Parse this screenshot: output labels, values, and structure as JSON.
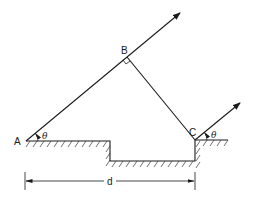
{
  "diagram": {
    "points": {
      "A": {
        "label": "A",
        "x": 26,
        "y": 141
      },
      "B": {
        "label": "B",
        "x": 127,
        "y": 57
      },
      "C": {
        "label": "C",
        "x": 195,
        "y": 140
      }
    },
    "angles": {
      "at_A": "θ",
      "at_C": "θ"
    },
    "dimension": {
      "label": "d",
      "from": "A",
      "to": "C"
    },
    "annotations": {
      "right_angle_at": "B"
    },
    "colors": {
      "line": "#1a1a1a",
      "background": "#ffffff"
    }
  }
}
